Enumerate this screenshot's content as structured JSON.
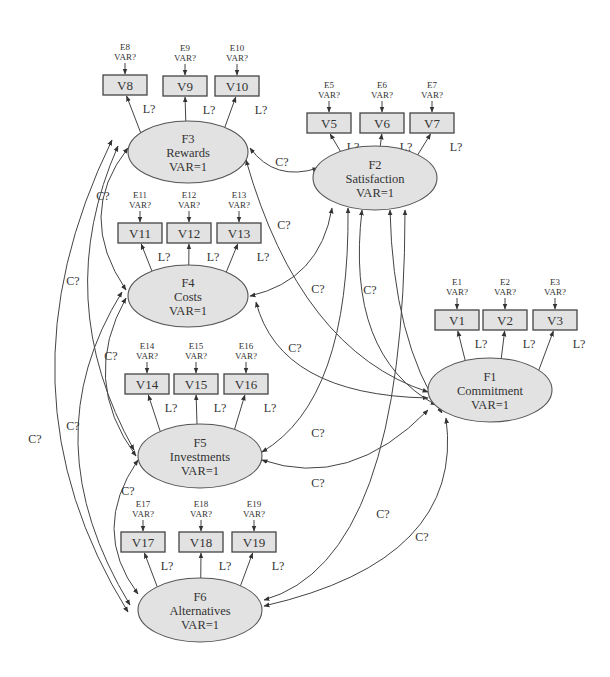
{
  "factors": [
    {
      "id": "F1",
      "name": "Commitment",
      "var": "VAR=1",
      "cx": 490,
      "cy": 390,
      "rx": 62,
      "ry": 32
    },
    {
      "id": "F2",
      "name": "Satisfaction",
      "var": "VAR=1",
      "cx": 375,
      "cy": 178,
      "rx": 62,
      "ry": 32
    },
    {
      "id": "F3",
      "name": "Rewards",
      "var": "VAR=1",
      "cx": 188,
      "cy": 152,
      "rx": 60,
      "ry": 31
    },
    {
      "id": "F4",
      "name": "Costs",
      "var": "VAR=1",
      "cx": 188,
      "cy": 296,
      "rx": 60,
      "ry": 31
    },
    {
      "id": "F5",
      "name": "Investments",
      "var": "VAR=1",
      "cx": 200,
      "cy": 456,
      "rx": 62,
      "ry": 32
    },
    {
      "id": "F6",
      "name": "Alternatives",
      "var": "VAR=1",
      "cx": 200,
      "cy": 610,
      "rx": 62,
      "ry": 32
    }
  ],
  "indicators": [
    {
      "id": "V1",
      "error": "E1",
      "err_var": "VAR?",
      "factor": "F1",
      "x": 435,
      "y": 310
    },
    {
      "id": "V2",
      "error": "E2",
      "err_var": "VAR?",
      "factor": "F1",
      "x": 483,
      "y": 310
    },
    {
      "id": "V3",
      "error": "E3",
      "err_var": "VAR?",
      "factor": "F1",
      "x": 533,
      "y": 310
    },
    {
      "id": "V5",
      "error": "E5",
      "err_var": "VAR?",
      "factor": "F2",
      "x": 307,
      "y": 113
    },
    {
      "id": "V6",
      "error": "E6",
      "err_var": "VAR?",
      "factor": "F2",
      "x": 360,
      "y": 113
    },
    {
      "id": "V7",
      "error": "E7",
      "err_var": "VAR?",
      "factor": "F2",
      "x": 410,
      "y": 113
    },
    {
      "id": "V8",
      "error": "E8",
      "err_var": "VAR?",
      "factor": "F3",
      "x": 103,
      "y": 75
    },
    {
      "id": "V9",
      "error": "E9",
      "err_var": "VAR?",
      "factor": "F3",
      "x": 163,
      "y": 76
    },
    {
      "id": "V10",
      "error": "E10",
      "err_var": "VAR?",
      "factor": "F3",
      "x": 215,
      "y": 76
    },
    {
      "id": "V11",
      "error": "E11",
      "err_var": "VAR?",
      "factor": "F4",
      "x": 118,
      "y": 223
    },
    {
      "id": "V12",
      "error": "E12",
      "err_var": "VAR?",
      "factor": "F4",
      "x": 167,
      "y": 223
    },
    {
      "id": "V13",
      "error": "E13",
      "err_var": "VAR?",
      "factor": "F4",
      "x": 217,
      "y": 223
    },
    {
      "id": "V14",
      "error": "E14",
      "err_var": "VAR?",
      "factor": "F5",
      "x": 125,
      "y": 374
    },
    {
      "id": "V15",
      "error": "E15",
      "err_var": "VAR?",
      "factor": "F5",
      "x": 174,
      "y": 374
    },
    {
      "id": "V16",
      "error": "E16",
      "err_var": "VAR?",
      "factor": "F5",
      "x": 224,
      "y": 374
    },
    {
      "id": "V17",
      "error": "E17",
      "err_var": "VAR?",
      "factor": "F6",
      "x": 121,
      "y": 532
    },
    {
      "id": "V18",
      "error": "E18",
      "err_var": "VAR?",
      "factor": "F6",
      "x": 179,
      "y": 532
    },
    {
      "id": "V19",
      "error": "E19",
      "err_var": "VAR?",
      "factor": "F6",
      "x": 232,
      "y": 532
    }
  ],
  "loading_label": "L?",
  "covariance_label": "C?",
  "covariance_labels": [
    {
      "between": "F3-F2",
      "x": 282,
      "y": 166
    },
    {
      "between": "F3-F1",
      "x": 284,
      "y": 229
    },
    {
      "between": "F4-F3 (left)",
      "x": 103,
      "y": 200
    },
    {
      "between": "F4-F2",
      "x": 318,
      "y": 293
    },
    {
      "between": "F2-F1",
      "x": 370,
      "y": 294
    },
    {
      "between": "F4-F1",
      "x": 295,
      "y": 352
    },
    {
      "between": "F3-F5",
      "x": 73,
      "y": 285
    },
    {
      "between": "F4-F5",
      "x": 111,
      "y": 360
    },
    {
      "between": "F5-F1",
      "x": 318,
      "y": 437
    },
    {
      "between": "F5-F6",
      "x": 128,
      "y": 495
    },
    {
      "between": "F4-F6",
      "x": 73,
      "y": 430
    },
    {
      "between": "F3-F6",
      "x": 35,
      "y": 443
    },
    {
      "between": "F6-F2",
      "x": 318,
      "y": 487
    },
    {
      "between": "F6-F2b",
      "x": 383,
      "y": 518
    },
    {
      "between": "F6-F1",
      "x": 422,
      "y": 541
    }
  ],
  "colors": {
    "node_fill": "#e2e2e2",
    "stroke": "#444444",
    "text": "#333333",
    "background": "#ffffff"
  }
}
